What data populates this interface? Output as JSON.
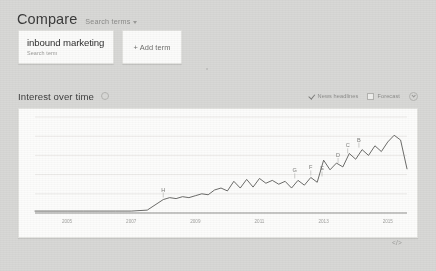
{
  "compare": {
    "title": "Compare",
    "dropdown_label": "Search terms",
    "caret_icon": "chevron-down-icon",
    "terms": [
      {
        "term": "inbound marketing",
        "subtitle": "Search term"
      }
    ],
    "add_term_label": "+ Add term"
  },
  "interest": {
    "title": "Interest over time",
    "info_icon": "info-circle-icon",
    "news_headlines": {
      "label": "News headlines",
      "checked": true,
      "icon": "check-icon"
    },
    "forecast": {
      "label": "Forecast",
      "checked": false,
      "icon": "checkbox-icon"
    },
    "download_icon": "download-circle-icon",
    "embed_label": "</>"
  },
  "colors": {
    "page_background": "#d8d8d6",
    "card_background": "#fcfcfb",
    "card_border": "#e4e4e1",
    "line": "#5b5b59",
    "gridline": "#eceae8",
    "axis": "#6f6f6d",
    "text_primary": "#3b3b3b",
    "text_muted": "#9b9b99"
  },
  "chart_data": {
    "type": "line",
    "title": "Interest over time",
    "xlabel": "",
    "ylabel": "",
    "ylim": [
      0,
      100
    ],
    "grid": true,
    "legend_position": "none",
    "x_tick_labels": [
      "2005",
      "2007",
      "2009",
      "2011",
      "2013",
      "2015"
    ],
    "series": [
      {
        "name": "inbound marketing",
        "x": [
          2004.0,
          2004.5,
          2005.0,
          2005.5,
          2006.0,
          2006.5,
          2007.0,
          2007.5,
          2008.0,
          2008.2,
          2008.4,
          2008.6,
          2008.8,
          2009.0,
          2009.2,
          2009.4,
          2009.6,
          2009.8,
          2010.0,
          2010.2,
          2010.4,
          2010.6,
          2010.8,
          2011.0,
          2011.2,
          2011.4,
          2011.6,
          2011.8,
          2012.0,
          2012.2,
          2012.4,
          2012.6,
          2012.8,
          2013.0,
          2013.2,
          2013.4,
          2013.6,
          2013.8,
          2014.0,
          2014.2,
          2014.4,
          2014.6,
          2014.8,
          2015.0,
          2015.2,
          2015.4,
          2015.6
        ],
        "values": [
          2,
          2,
          2,
          2,
          2,
          2,
          2,
          3,
          14,
          16,
          15,
          17,
          16,
          18,
          20,
          19,
          24,
          26,
          23,
          33,
          26,
          35,
          27,
          36,
          31,
          34,
          30,
          33,
          26,
          34,
          29,
          37,
          32,
          55,
          45,
          52,
          48,
          62,
          56,
          66,
          60,
          70,
          64,
          74,
          81,
          76,
          46
        ]
      }
    ],
    "annotations": [
      {
        "label": "H",
        "x": 2008.0,
        "y": 14
      },
      {
        "label": "G",
        "x": 2012.1,
        "y": 34
      },
      {
        "label": "F",
        "x": 2012.6,
        "y": 37
      },
      {
        "label": "E",
        "x": 2012.95,
        "y": 36
      },
      {
        "label": "D",
        "x": 2013.45,
        "y": 50
      },
      {
        "label": "C",
        "x": 2013.75,
        "y": 60
      },
      {
        "label": "B",
        "x": 2014.1,
        "y": 66
      }
    ]
  }
}
